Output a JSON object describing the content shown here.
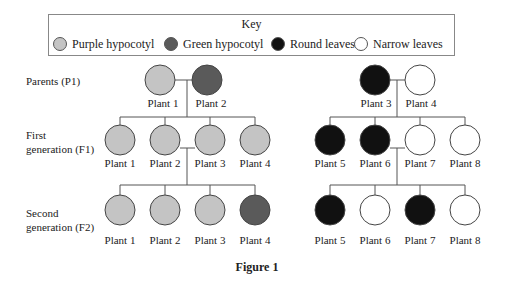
{
  "key": {
    "title": "Key",
    "items": [
      {
        "label": "Purple hypocotyl",
        "color": "#c4c4c4"
      },
      {
        "label": "Green hypocotyl",
        "color": "#5a5a5a"
      },
      {
        "label": "Round leaves",
        "color": "#111111"
      },
      {
        "label": "Narrow leaves",
        "color": "#ffffff"
      }
    ]
  },
  "rows": {
    "p1": "Parents (P1)",
    "f1": [
      "First",
      "generation (F1)"
    ],
    "f2": [
      "Second",
      "generation (F2)"
    ]
  },
  "left_family": {
    "parents": [
      {
        "label": "Plant 1",
        "color": "#c4c4c4"
      },
      {
        "label": "Plant 2",
        "color": "#5a5a5a"
      }
    ],
    "f1": [
      {
        "label": "Plant 1",
        "color": "#c4c4c4"
      },
      {
        "label": "Plant 2",
        "color": "#c4c4c4"
      },
      {
        "label": "Plant 3",
        "color": "#c4c4c4"
      },
      {
        "label": "Plant 4",
        "color": "#c4c4c4"
      }
    ],
    "f2": [
      {
        "label": "Plant 1",
        "color": "#c4c4c4"
      },
      {
        "label": "Plant 2",
        "color": "#c4c4c4"
      },
      {
        "label": "Plant 3",
        "color": "#c4c4c4"
      },
      {
        "label": "Plant 4",
        "color": "#5a5a5a"
      }
    ]
  },
  "right_family": {
    "parents": [
      {
        "label": "Plant 3",
        "color": "#111111"
      },
      {
        "label": "Plant 4",
        "color": "#ffffff"
      }
    ],
    "f1": [
      {
        "label": "Plant 5",
        "color": "#111111"
      },
      {
        "label": "Plant 6",
        "color": "#111111"
      },
      {
        "label": "Plant 7",
        "color": "#ffffff"
      },
      {
        "label": "Plant 8",
        "color": "#ffffff"
      }
    ],
    "f2": [
      {
        "label": "Plant 5",
        "color": "#111111"
      },
      {
        "label": "Plant 6",
        "color": "#ffffff"
      },
      {
        "label": "Plant 7",
        "color": "#111111"
      },
      {
        "label": "Plant 8",
        "color": "#ffffff"
      }
    ]
  },
  "caption": "Figure 1"
}
